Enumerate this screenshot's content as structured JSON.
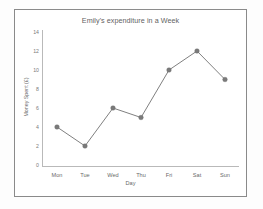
{
  "figure": {
    "frame_color": "#8a8a8a",
    "background": "#ffffff"
  },
  "chart_data": {
    "type": "line",
    "title": "Emily's expenditure in a Week",
    "xlabel": "Day",
    "ylabel": "Money Spent (£)",
    "categories": [
      "Mon",
      "Tue",
      "Wed",
      "Thu",
      "Fri",
      "Sat",
      "Sun"
    ],
    "values": [
      4,
      2,
      6,
      5,
      10,
      12,
      9
    ],
    "ylim": [
      0,
      14
    ],
    "ytick_labels": [
      "14",
      "12",
      "10",
      "8",
      "6",
      "4",
      "2",
      "0"
    ],
    "ytick_values": [
      14,
      12,
      10,
      8,
      6,
      4,
      2,
      0
    ],
    "ytick_step": 2,
    "grid": false,
    "legend": "none",
    "line_color": "#808080",
    "marker_color": "#7a7a7a",
    "marker_shape": "circle"
  }
}
